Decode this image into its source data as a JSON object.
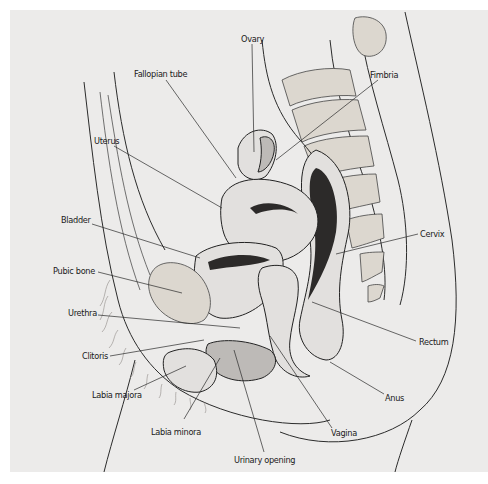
{
  "diagram": {
    "labels": [
      {
        "id": "ovary",
        "text": "Ovary"
      },
      {
        "id": "fallopian-tube",
        "text": "Fallopian tube"
      },
      {
        "id": "fimbria",
        "text": "Fimbria"
      },
      {
        "id": "uterus",
        "text": "Uterus"
      },
      {
        "id": "bladder",
        "text": "Bladder"
      },
      {
        "id": "cervix",
        "text": "Cervix"
      },
      {
        "id": "pubic-bone",
        "text": "Pubic bone"
      },
      {
        "id": "urethra",
        "text": "Urethra"
      },
      {
        "id": "rectum",
        "text": "Rectum"
      },
      {
        "id": "clitoris",
        "text": "Clitoris"
      },
      {
        "id": "labia-majora",
        "text": "Labia majora"
      },
      {
        "id": "anus",
        "text": "Anus"
      },
      {
        "id": "labia-minora",
        "text": "Labia minora"
      },
      {
        "id": "vagina",
        "text": "Vagina"
      },
      {
        "id": "urinary-opening",
        "text": "Urinary opening"
      }
    ]
  }
}
